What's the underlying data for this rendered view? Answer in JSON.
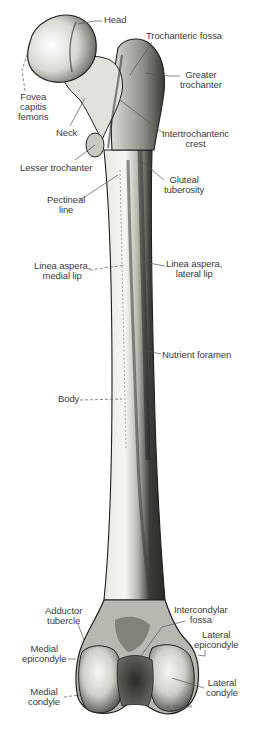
{
  "figure": {
    "colors": {
      "background": "#ffffff",
      "ink": "#1e1e1e",
      "bone_light": "#f2f2ee",
      "bone_mid": "#bdbdb6",
      "bone_dark": "#4a4a46",
      "label": "#3a3a3a",
      "leader": "#555555"
    },
    "signature": "W. SKIDDER"
  },
  "labels": [
    {
      "id": "head",
      "text": "Head",
      "x": 104,
      "y": 16,
      "align": "left",
      "leader": [
        [
          102,
          21
        ],
        [
          95,
          21
        ],
        [
          78,
          24
        ]
      ]
    },
    {
      "id": "trochanteric-fossa",
      "text": "Trochanteric fossa",
      "x": 146,
      "y": 32,
      "align": "left",
      "leader": [
        [
          152,
          42
        ],
        [
          130,
          75
        ]
      ]
    },
    {
      "id": "greater-trochanter",
      "text": "Greater\ntrochanter",
      "x": 182,
      "y": 70,
      "align": "left",
      "leader": [
        [
          180,
          76
        ],
        [
          170,
          76
        ],
        [
          145,
          73
        ]
      ]
    },
    {
      "id": "fovea-capitis-femoris",
      "text": "Fovea\ncapitis\nfemoris",
      "x": 20,
      "y": 92,
      "align": "left",
      "leader": [
        [
          25,
          91
        ],
        [
          22,
          70
        ],
        [
          28,
          52
        ]
      ]
    },
    {
      "id": "neck",
      "text": "Neck",
      "x": 57,
      "y": 129,
      "align": "left",
      "leader": [
        [
          70,
          126
        ],
        [
          85,
          98
        ]
      ]
    },
    {
      "id": "intertrochanteric-crest",
      "text": "Intertrochanteric\ncrest",
      "x": 163,
      "y": 129,
      "align": "left",
      "leader": [
        [
          163,
          133
        ],
        [
          120,
          100
        ]
      ]
    },
    {
      "id": "lesser-trochanter",
      "text": "Lesser trochanter",
      "x": 20,
      "y": 163,
      "align": "left",
      "leader": [
        [
          75,
          160
        ],
        [
          95,
          145
        ]
      ]
    },
    {
      "id": "gluteal-tuberosity",
      "text": "Gluteal\ntuberosity",
      "x": 164,
      "y": 175,
      "align": "left",
      "leader": [
        [
          164,
          180
        ],
        [
          140,
          160
        ]
      ]
    },
    {
      "id": "pectineal-line",
      "text": "Pectineal\nline",
      "x": 47,
      "y": 195,
      "align": "center",
      "leader": [
        [
          80,
          200
        ],
        [
          118,
          175
        ]
      ]
    },
    {
      "id": "linea-aspera-medial-lip",
      "text": "Linea aspera,\nmedial lip",
      "x": 34,
      "y": 261,
      "align": "center",
      "leader": [
        [
          90,
          270
        ],
        [
          125,
          265
        ]
      ]
    },
    {
      "id": "linea-aspera-lateral-lip",
      "text": "Linea aspera,\nlateral lip",
      "x": 166,
      "y": 259,
      "align": "center",
      "leader": [
        [
          165,
          266
        ],
        [
          143,
          262
        ]
      ]
    },
    {
      "id": "nutrient-foramen",
      "text": "Nutrient foramen",
      "x": 162,
      "y": 350,
      "align": "left",
      "leader": [
        [
          161,
          354
        ],
        [
          142,
          350
        ]
      ]
    },
    {
      "id": "body",
      "text": "Body",
      "x": 58,
      "y": 394,
      "align": "left",
      "leader": [
        [
          80,
          400
        ],
        [
          122,
          399
        ]
      ]
    },
    {
      "id": "adductor-tubercle",
      "text": "Adductor\ntubercle",
      "x": 45,
      "y": 606,
      "align": "center",
      "leader": [
        [
          78,
          624
        ],
        [
          84,
          640
        ]
      ]
    },
    {
      "id": "intercondylar-fossa",
      "text": "Intercondylar\nfossa",
      "x": 174,
      "y": 605,
      "align": "center",
      "leader": [
        [
          185,
          621
        ],
        [
          162,
          627
        ],
        [
          138,
          660
        ]
      ]
    },
    {
      "id": "lateral-epicondyle",
      "text": "Lateral\nepicondyle",
      "x": 194,
      "y": 630,
      "align": "center",
      "leader": [
        [
          205,
          650
        ],
        [
          205,
          656
        ],
        [
          198,
          655
        ]
      ]
    },
    {
      "id": "medial-epicondyle",
      "text": "Medial\nepicondyle",
      "x": 22,
      "y": 644,
      "align": "center",
      "leader": [
        [
          68,
          659
        ],
        [
          76,
          659
        ]
      ]
    },
    {
      "id": "lateral-condyle",
      "text": "Lateral\ncondyle",
      "x": 206,
      "y": 678,
      "align": "center",
      "leader": [
        [
          204,
          688
        ],
        [
          172,
          678
        ]
      ]
    },
    {
      "id": "medial-condyle",
      "text": "Medial\ncondyle",
      "x": 28,
      "y": 687,
      "align": "center",
      "leader": [
        [
          64,
          697
        ],
        [
          80,
          695
        ]
      ]
    }
  ]
}
